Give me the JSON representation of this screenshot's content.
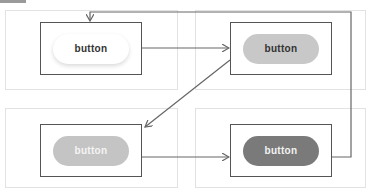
{
  "diagram": {
    "states": [
      {
        "id": "default",
        "label": "button",
        "fill": "#ffffff",
        "text_color": "#333333"
      },
      {
        "id": "hover",
        "label": "button",
        "fill": "#c8c8c8",
        "text_color": "#333333"
      },
      {
        "id": "disabled",
        "label": "button",
        "fill": "#c4c4c4",
        "text_color": "#f4f4f4"
      },
      {
        "id": "active",
        "label": "button",
        "fill": "#7a7a7a",
        "text_color": "#f2f2f2"
      }
    ],
    "transitions": [
      {
        "from": "default",
        "to": "hover"
      },
      {
        "from": "hover",
        "to": "disabled"
      },
      {
        "from": "disabled",
        "to": "active"
      },
      {
        "from": "active",
        "to": "default"
      }
    ],
    "colors": {
      "line": "#666666",
      "box_border": "#555555",
      "panel_border": "#e2e2e2"
    }
  }
}
